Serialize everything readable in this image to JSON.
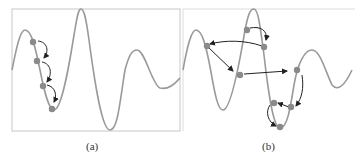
{
  "figure": {
    "panels": [
      {
        "id": "a",
        "caption": "(a)",
        "description": "Local gradient descent steps descending into a nearby local minimum",
        "points": [
          [
            33,
            42
          ],
          [
            37,
            61
          ],
          [
            43,
            86
          ],
          [
            52,
            109
          ]
        ]
      },
      {
        "id": "b",
        "caption": "(b)",
        "description": "Non-local jumps exploring the landscape, converging to global minimum",
        "points": [
          [
            247,
            30
          ],
          [
            264,
            47
          ],
          [
            207,
            46
          ],
          [
            240,
            75
          ],
          [
            297,
            70
          ],
          [
            291,
            107
          ],
          [
            274,
            103
          ],
          [
            280,
            127
          ]
        ]
      }
    ],
    "colors": {
      "curve": "#9a9a9a",
      "frame": "#c8c8c8",
      "point": "#8a8a8a",
      "arrow": "#222222"
    }
  }
}
